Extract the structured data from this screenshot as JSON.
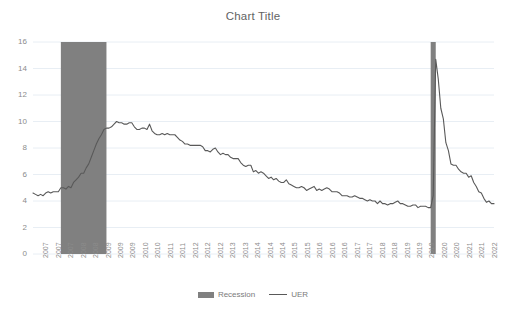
{
  "chart_data": {
    "type": "line",
    "title": "Chart Title",
    "xlabel": "",
    "ylabel": "",
    "ylim": [
      0,
      16
    ],
    "yticks": [
      0,
      2,
      4,
      6,
      8,
      10,
      12,
      14,
      16
    ],
    "grid": true,
    "legend_position": "bottom",
    "legend": [
      "Recession",
      "UER"
    ],
    "colors": {
      "recession_fill": "#808080",
      "uer_line": "#595959",
      "gridline": "#e8eef4",
      "axis_text": "#8c8c8c",
      "title_text": "#636363",
      "background": "#ffffff"
    },
    "xtick_labels": [
      "2007",
      "2007",
      "2007",
      "2008",
      "2008",
      "2009",
      "2009",
      "2009",
      "2010",
      "2010",
      "2011",
      "2011",
      "2012",
      "2012",
      "2012",
      "2013",
      "2013",
      "2014",
      "2014",
      "2014",
      "2015",
      "2015",
      "2016",
      "2016",
      "2016",
      "2017",
      "2017",
      "2018",
      "2018",
      "2019",
      "2019",
      "2019",
      "2020",
      "2020",
      "2021",
      "2021",
      "2022"
    ],
    "x_range_start": "2007-01",
    "x_range_end": "2022-03",
    "series": [
      {
        "name": "UER",
        "type": "line",
        "x": [
          "2007-01",
          "2007-02",
          "2007-03",
          "2007-04",
          "2007-05",
          "2007-06",
          "2007-07",
          "2007-08",
          "2007-09",
          "2007-10",
          "2007-11",
          "2007-12",
          "2008-01",
          "2008-02",
          "2008-03",
          "2008-04",
          "2008-05",
          "2008-06",
          "2008-07",
          "2008-08",
          "2008-09",
          "2008-10",
          "2008-11",
          "2008-12",
          "2009-01",
          "2009-02",
          "2009-03",
          "2009-04",
          "2009-05",
          "2009-06",
          "2009-07",
          "2009-08",
          "2009-09",
          "2009-10",
          "2009-11",
          "2009-12",
          "2010-01",
          "2010-02",
          "2010-03",
          "2010-04",
          "2010-05",
          "2010-06",
          "2010-07",
          "2010-08",
          "2010-09",
          "2010-10",
          "2010-11",
          "2010-12",
          "2011-01",
          "2011-02",
          "2011-03",
          "2011-04",
          "2011-05",
          "2011-06",
          "2011-07",
          "2011-08",
          "2011-09",
          "2011-10",
          "2011-11",
          "2011-12",
          "2012-01",
          "2012-02",
          "2012-03",
          "2012-04",
          "2012-05",
          "2012-06",
          "2012-07",
          "2012-08",
          "2012-09",
          "2012-10",
          "2012-11",
          "2012-12",
          "2013-01",
          "2013-02",
          "2013-03",
          "2013-04",
          "2013-05",
          "2013-06",
          "2013-07",
          "2013-08",
          "2013-09",
          "2013-10",
          "2013-11",
          "2013-12",
          "2014-01",
          "2014-02",
          "2014-03",
          "2014-04",
          "2014-05",
          "2014-06",
          "2014-07",
          "2014-08",
          "2014-09",
          "2014-10",
          "2014-11",
          "2014-12",
          "2015-01",
          "2015-02",
          "2015-03",
          "2015-04",
          "2015-05",
          "2015-06",
          "2015-07",
          "2015-08",
          "2015-09",
          "2015-10",
          "2015-11",
          "2015-12",
          "2016-01",
          "2016-02",
          "2016-03",
          "2016-04",
          "2016-05",
          "2016-06",
          "2016-07",
          "2016-08",
          "2016-09",
          "2016-10",
          "2016-11",
          "2016-12",
          "2017-01",
          "2017-02",
          "2017-03",
          "2017-04",
          "2017-05",
          "2017-06",
          "2017-07",
          "2017-08",
          "2017-09",
          "2017-10",
          "2017-11",
          "2017-12",
          "2018-01",
          "2018-02",
          "2018-03",
          "2018-04",
          "2018-05",
          "2018-06",
          "2018-07",
          "2018-08",
          "2018-09",
          "2018-10",
          "2018-11",
          "2018-12",
          "2019-01",
          "2019-02",
          "2019-03",
          "2019-04",
          "2019-05",
          "2019-06",
          "2019-07",
          "2019-08",
          "2019-09",
          "2019-10",
          "2019-11",
          "2019-12",
          "2020-01",
          "2020-02",
          "2020-03",
          "2020-04",
          "2020-05",
          "2020-06",
          "2020-07",
          "2020-08",
          "2020-09",
          "2020-10",
          "2020-11",
          "2020-12",
          "2021-01",
          "2021-02",
          "2021-03",
          "2021-04",
          "2021-05",
          "2021-06",
          "2021-07",
          "2021-08",
          "2021-09",
          "2021-10",
          "2021-11",
          "2021-12",
          "2022-01",
          "2022-02",
          "2022-03"
        ],
        "values": [
          4.6,
          4.5,
          4.4,
          4.5,
          4.4,
          4.6,
          4.7,
          4.6,
          4.7,
          4.7,
          4.7,
          5.0,
          5.0,
          4.9,
          5.1,
          5.0,
          5.4,
          5.6,
          5.8,
          6.1,
          6.1,
          6.5,
          6.8,
          7.3,
          7.8,
          8.3,
          8.7,
          9.0,
          9.4,
          9.5,
          9.5,
          9.6,
          9.8,
          10.0,
          9.9,
          9.9,
          9.8,
          9.8,
          9.9,
          9.9,
          9.6,
          9.4,
          9.4,
          9.5,
          9.5,
          9.4,
          9.8,
          9.3,
          9.1,
          9.0,
          9.0,
          9.1,
          9.0,
          9.1,
          9.0,
          9.0,
          9.0,
          8.8,
          8.6,
          8.5,
          8.3,
          8.3,
          8.2,
          8.2,
          8.2,
          8.2,
          8.2,
          8.1,
          7.8,
          7.8,
          7.7,
          7.9,
          8.0,
          7.7,
          7.5,
          7.6,
          7.5,
          7.5,
          7.3,
          7.2,
          7.2,
          7.2,
          6.9,
          6.7,
          6.6,
          6.7,
          6.7,
          6.2,
          6.3,
          6.1,
          6.2,
          6.1,
          5.9,
          5.7,
          5.8,
          5.6,
          5.7,
          5.5,
          5.4,
          5.4,
          5.6,
          5.3,
          5.2,
          5.1,
          5.0,
          5.0,
          5.1,
          5.0,
          4.8,
          4.9,
          5.0,
          5.1,
          4.8,
          4.9,
          4.8,
          4.9,
          5.0,
          4.9,
          4.7,
          4.7,
          4.7,
          4.6,
          4.4,
          4.4,
          4.4,
          4.3,
          4.3,
          4.4,
          4.3,
          4.2,
          4.2,
          4.1,
          4.0,
          4.1,
          4.0,
          4.0,
          3.8,
          4.0,
          3.8,
          3.8,
          3.7,
          3.8,
          3.8,
          3.9,
          4.0,
          3.8,
          3.8,
          3.7,
          3.6,
          3.6,
          3.7,
          3.7,
          3.5,
          3.6,
          3.6,
          3.6,
          3.5,
          3.5,
          4.4,
          14.7,
          13.2,
          11.0,
          10.2,
          8.4,
          7.8,
          6.8,
          6.7,
          6.7,
          6.4,
          6.2,
          6.1,
          6.1,
          5.8,
          5.9,
          5.4,
          5.1,
          4.7,
          4.6,
          4.2,
          3.9,
          4.0,
          3.8,
          3.8
        ]
      },
      {
        "name": "Recession",
        "type": "shaded-bands",
        "bands": [
          {
            "start": "2007-12",
            "end": "2009-06"
          },
          {
            "start": "2020-02",
            "end": "2020-04"
          }
        ],
        "band_value": 16
      }
    ]
  },
  "legend": {
    "items": [
      {
        "label": "Recession",
        "marker": "swatch-box"
      },
      {
        "label": "UER",
        "marker": "swatch-line"
      }
    ]
  }
}
